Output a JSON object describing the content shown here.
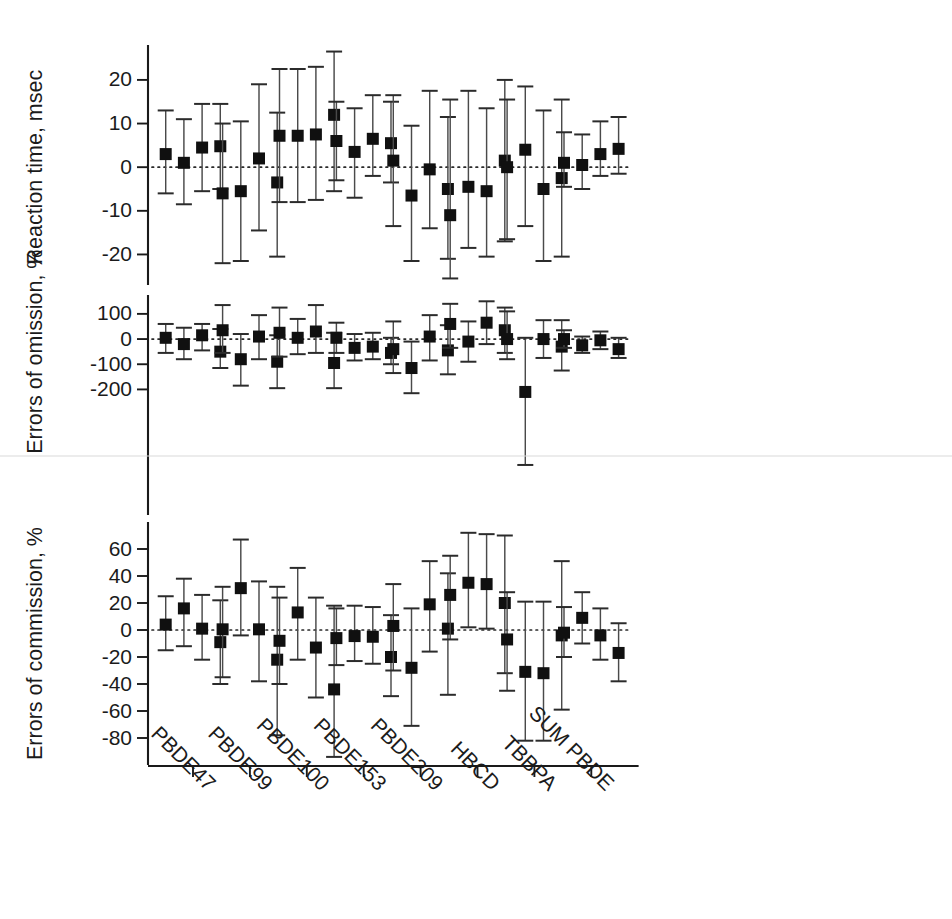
{
  "figure": {
    "background": "#ffffff",
    "marker_color": "#101010",
    "whisker_color": "#4a4a4a",
    "zero_line_color": "#2a2a2a"
  },
  "chart_data": {
    "type": "scatter",
    "title": "",
    "subtitle": "",
    "xlabel": "",
    "grid": false,
    "legend": "none",
    "categories": [
      "PBDE47",
      "PBDE99",
      "PBDE100",
      "PBDE153",
      "PBDE209",
      "HBCD",
      "TBBPA",
      "SUM PBDE"
    ],
    "points_per_category": 4,
    "annotations": [
      "Dotted horizontal reference line at zero in each panel"
    ],
    "panels": [
      {
        "id": "reaction-time",
        "ylabel": "Reaction time, msec",
        "ylim": [
          -27,
          28
        ],
        "yticks": [
          20,
          10,
          0,
          -10,
          -20
        ],
        "ytick_labels": [
          "20",
          "10",
          "0",
          "-10",
          "-20"
        ],
        "series": [
          {
            "category": "PBDE47",
            "values": [
              {
                "estimate": 3.0,
                "low": -6.0,
                "high": 13.0
              },
              {
                "estimate": 1.0,
                "low": -8.5,
                "high": 11.0
              },
              {
                "estimate": 4.5,
                "low": -5.5,
                "high": 14.5
              },
              {
                "estimate": 4.8,
                "low": -5.0,
                "high": 14.5
              }
            ]
          },
          {
            "category": "PBDE99",
            "values": [
              {
                "estimate": -6.0,
                "low": -22.0,
                "high": 10.0
              },
              {
                "estimate": -5.5,
                "low": -21.5,
                "high": 10.5
              },
              {
                "estimate": 2.0,
                "low": -14.5,
                "high": 19.0
              },
              {
                "estimate": -3.5,
                "low": -20.5,
                "high": 12.5
              }
            ]
          },
          {
            "category": "PBDE100",
            "values": [
              {
                "estimate": 7.2,
                "low": -8.0,
                "high": 22.5
              },
              {
                "estimate": 7.2,
                "low": -8.0,
                "high": 22.5
              },
              {
                "estimate": 7.5,
                "low": -7.5,
                "high": 23.0
              },
              {
                "estimate": 12.0,
                "low": -5.5,
                "high": 26.5
              }
            ]
          },
          {
            "category": "PBDE153",
            "values": [
              {
                "estimate": 6.0,
                "low": -3.0,
                "high": 15.0
              },
              {
                "estimate": 3.5,
                "low": -7.0,
                "high": 13.5
              },
              {
                "estimate": 6.5,
                "low": -2.0,
                "high": 16.5
              },
              {
                "estimate": 5.5,
                "low": -3.5,
                "high": 15.0
              }
            ]
          },
          {
            "category": "PBDE209",
            "values": [
              {
                "estimate": 1.5,
                "low": -13.5,
                "high": 16.5
              },
              {
                "estimate": -6.5,
                "low": -21.5,
                "high": 9.5
              },
              {
                "estimate": -0.5,
                "low": -14.0,
                "high": 17.5
              },
              {
                "estimate": -5.0,
                "low": -21.0,
                "high": 11.5
              }
            ]
          },
          {
            "category": "HBCD",
            "values": [
              {
                "estimate": -11.0,
                "low": -25.5,
                "high": 15.5
              },
              {
                "estimate": -4.5,
                "low": -18.5,
                "high": 17.5
              },
              {
                "estimate": -5.5,
                "low": -20.5,
                "high": 13.5
              },
              {
                "estimate": 1.5,
                "low": -17.0,
                "high": 20.0
              }
            ]
          },
          {
            "category": "TBBPA",
            "values": [
              {
                "estimate": 0.0,
                "low": -16.5,
                "high": 15.5
              },
              {
                "estimate": 4.0,
                "low": -13.5,
                "high": 18.5
              },
              {
                "estimate": -5.0,
                "low": -21.5,
                "high": 13.0
              },
              {
                "estimate": -2.5,
                "low": -20.5,
                "high": 15.5
              }
            ]
          },
          {
            "category": "SUM PBDE",
            "values": [
              {
                "estimate": 1.0,
                "low": -4.5,
                "high": 8.0
              },
              {
                "estimate": 0.5,
                "low": -5.0,
                "high": 7.5
              },
              {
                "estimate": 3.0,
                "low": -2.0,
                "high": 10.5
              },
              {
                "estimate": 4.2,
                "low": -1.5,
                "high": 11.5
              }
            ]
          }
        ]
      },
      {
        "id": "errors-of-omission",
        "ylabel": "Errors of omission, %",
        "ylim": [
          -520,
          175
        ],
        "yticks": [
          100,
          0,
          -100,
          -200
        ],
        "ytick_labels": [
          "100",
          "0",
          "-100",
          "-200"
        ],
        "series": [
          {
            "category": "PBDE47",
            "values": [
              {
                "estimate": 5.0,
                "low": -55.0,
                "high": 60.0
              },
              {
                "estimate": -20.0,
                "low": -80.0,
                "high": 45.0
              },
              {
                "estimate": 15.0,
                "low": -45.0,
                "high": 60.0
              },
              {
                "estimate": -50.0,
                "low": -115.0,
                "high": 40.0
              }
            ]
          },
          {
            "category": "PBDE99",
            "values": [
              {
                "estimate": 35.0,
                "low": -55.0,
                "high": 135.0
              },
              {
                "estimate": -80.0,
                "low": -185.0,
                "high": 20.0
              },
              {
                "estimate": 10.0,
                "low": -80.0,
                "high": 95.0
              },
              {
                "estimate": -90.0,
                "low": -195.0,
                "high": 15.0
              }
            ]
          },
          {
            "category": "PBDE100",
            "values": [
              {
                "estimate": 25.0,
                "low": -70.0,
                "high": 125.0
              },
              {
                "estimate": 5.0,
                "low": -60.0,
                "high": 80.0
              },
              {
                "estimate": 30.0,
                "low": -55.0,
                "high": 135.0
              },
              {
                "estimate": -95.0,
                "low": -195.0,
                "high": 25.0
              }
            ]
          },
          {
            "category": "PBDE153",
            "values": [
              {
                "estimate": 5.0,
                "low": -55.0,
                "high": 65.0
              },
              {
                "estimate": -35.0,
                "low": -85.0,
                "high": 20.0
              },
              {
                "estimate": -30.0,
                "low": -80.0,
                "high": 25.0
              },
              {
                "estimate": -55.0,
                "low": -100.0,
                "high": 5.0
              }
            ]
          },
          {
            "category": "PBDE209",
            "values": [
              {
                "estimate": -40.0,
                "low": -135.0,
                "high": 70.0
              },
              {
                "estimate": -115.0,
                "low": -215.0,
                "high": -10.0
              },
              {
                "estimate": 10.0,
                "low": -85.0,
                "high": 95.0
              },
              {
                "estimate": -45.0,
                "low": -140.0,
                "high": 55.0
              }
            ]
          },
          {
            "category": "HBCD",
            "values": [
              {
                "estimate": 60.0,
                "low": -35.0,
                "high": 140.0
              },
              {
                "estimate": -10.0,
                "low": -90.0,
                "high": 70.0
              },
              {
                "estimate": 65.0,
                "low": -20.0,
                "high": 150.0
              },
              {
                "estimate": 35.0,
                "low": -55.0,
                "high": 125.0
              }
            ]
          },
          {
            "category": "TBBPA",
            "values": [
              {
                "estimate": 0.0,
                "low": -80.0,
                "high": 110.0
              },
              {
                "estimate": -210.0,
                "low": -500.0,
                "high": 5.0
              },
              {
                "estimate": 0.0,
                "low": -75.0,
                "high": 75.0
              },
              {
                "estimate": -30.0,
                "low": -125.0,
                "high": 75.0
              }
            ]
          },
          {
            "category": "SUM PBDE",
            "values": [
              {
                "estimate": 0.0,
                "low": -35.0,
                "high": 35.0
              },
              {
                "estimate": -25.0,
                "low": -55.0,
                "high": 10.0
              },
              {
                "estimate": -5.0,
                "low": -40.0,
                "high": 30.0
              },
              {
                "estimate": -40.0,
                "low": -75.0,
                "high": 5.0
              }
            ]
          }
        ]
      },
      {
        "id": "errors-of-commission",
        "ylabel": "Errors of commission, %",
        "ylim": [
          -100,
          80
        ],
        "yticks": [
          60,
          40,
          20,
          0,
          -20,
          -40,
          -60,
          -80
        ],
        "ytick_labels": [
          "60",
          "40",
          "20",
          "0",
          "-20",
          "-40",
          "-60",
          "-80"
        ],
        "series": [
          {
            "category": "PBDE47",
            "values": [
              {
                "estimate": 4.0,
                "low": -15.0,
                "high": 25.0
              },
              {
                "estimate": 16.0,
                "low": -12.0,
                "high": 38.0
              },
              {
                "estimate": 1.0,
                "low": -22.0,
                "high": 26.0
              },
              {
                "estimate": -9.0,
                "low": -40.0,
                "high": 22.0
              }
            ]
          },
          {
            "category": "PBDE99",
            "values": [
              {
                "estimate": 0.5,
                "low": -35.0,
                "high": 32.0
              },
              {
                "estimate": 31.0,
                "low": -4.0,
                "high": 67.0
              },
              {
                "estimate": 0.5,
                "low": -38.0,
                "high": 36.0
              },
              {
                "estimate": -22.0,
                "low": -78.0,
                "high": 32.0
              }
            ]
          },
          {
            "category": "PBDE100",
            "values": [
              {
                "estimate": -8.0,
                "low": -40.0,
                "high": 24.0
              },
              {
                "estimate": 13.0,
                "low": -22.0,
                "high": 46.0
              },
              {
                "estimate": -13.0,
                "low": -50.0,
                "high": 24.0
              },
              {
                "estimate": -44.0,
                "low": -94.0,
                "high": 18.0
              }
            ]
          },
          {
            "category": "PBDE153",
            "values": [
              {
                "estimate": -6.0,
                "low": -26.0,
                "high": 16.0
              },
              {
                "estimate": -4.5,
                "low": -23.0,
                "high": 18.0
              },
              {
                "estimate": -5.0,
                "low": -25.0,
                "high": 17.0
              },
              {
                "estimate": -20.0,
                "low": -49.0,
                "high": 11.0
              }
            ]
          },
          {
            "category": "PBDE209",
            "values": [
              {
                "estimate": 3.0,
                "low": -30.0,
                "high": 34.0
              },
              {
                "estimate": -28.0,
                "low": -71.0,
                "high": 16.0
              },
              {
                "estimate": 19.0,
                "low": -16.0,
                "high": 51.0
              },
              {
                "estimate": 1.0,
                "low": -48.0,
                "high": 42.0
              }
            ]
          },
          {
            "category": "HBCD",
            "values": [
              {
                "estimate": 26.0,
                "low": -7.0,
                "high": 55.0
              },
              {
                "estimate": 35.0,
                "low": 2.0,
                "high": 72.0
              },
              {
                "estimate": 34.0,
                "low": 1.0,
                "high": 71.0
              },
              {
                "estimate": 20.0,
                "low": -32.0,
                "high": 70.0
              }
            ]
          },
          {
            "category": "TBBPA",
            "values": [
              {
                "estimate": -7.0,
                "low": -45.0,
                "high": 28.0
              },
              {
                "estimate": -31.0,
                "low": -82.0,
                "high": 21.0
              },
              {
                "estimate": -32.0,
                "low": -82.0,
                "high": 21.0
              },
              {
                "estimate": -4.0,
                "low": -59.0,
                "high": 51.0
              }
            ]
          },
          {
            "category": "SUM PBDE",
            "values": [
              {
                "estimate": -2.0,
                "low": -20.0,
                "high": 17.0
              },
              {
                "estimate": 9.0,
                "low": -10.0,
                "high": 28.0
              },
              {
                "estimate": -4.0,
                "low": -22.0,
                "high": 16.0
              },
              {
                "estimate": -17.0,
                "low": -38.0,
                "high": 5.0
              }
            ]
          }
        ]
      }
    ]
  }
}
